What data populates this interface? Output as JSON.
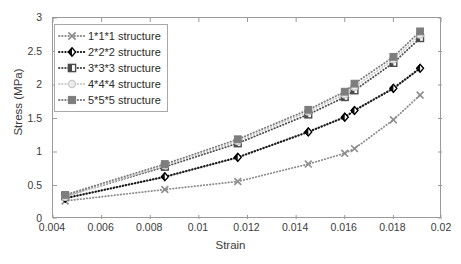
{
  "chart_data": {
    "type": "line",
    "title": "",
    "xlabel": "Strain",
    "ylabel": "Stress (MPa)",
    "xlim": [
      0.004,
      0.02
    ],
    "ylim": [
      0,
      3
    ],
    "xticks": [
      "0.004",
      "0.006",
      "0.008",
      "0.01",
      "0.012",
      "0.014",
      "0.016",
      "0.018",
      "0.02"
    ],
    "xtick_values": [
      0.004,
      0.006,
      0.008,
      0.01,
      0.012,
      0.014,
      0.016,
      0.018,
      0.02
    ],
    "yticks": [
      "0",
      "0.5",
      "1",
      "1.5",
      "2",
      "2.5",
      "3"
    ],
    "ytick_values": [
      0,
      0.5,
      1,
      1.5,
      2,
      2.5,
      3
    ],
    "grid": false,
    "linestyle": "dotted",
    "legend_position": "upper-left",
    "series": [
      {
        "name": "1*1*1 structure",
        "marker": "x-mark",
        "color": "#8c8c8c",
        "x": [
          0.0045,
          0.0086,
          0.0116,
          0.0145,
          0.016,
          0.0164,
          0.018,
          0.0191
        ],
        "y": [
          0.27,
          0.44,
          0.56,
          0.82,
          0.98,
          1.05,
          1.48,
          1.85
        ]
      },
      {
        "name": "2*2*2 structure",
        "marker": "diamond",
        "color": "#1a1a1a",
        "x": [
          0.0045,
          0.0086,
          0.0116,
          0.0145,
          0.016,
          0.0164,
          0.018,
          0.0191
        ],
        "y": [
          0.31,
          0.63,
          0.92,
          1.3,
          1.52,
          1.62,
          1.95,
          2.25
        ]
      },
      {
        "name": "3*3*3 structure",
        "marker": "square-filled-half",
        "color": "#4a4a4a",
        "x": [
          0.0045,
          0.0086,
          0.0116,
          0.0145,
          0.016,
          0.0164,
          0.018,
          0.0191
        ],
        "y": [
          0.34,
          0.78,
          1.13,
          1.56,
          1.82,
          1.92,
          2.33,
          2.7
        ]
      },
      {
        "name": "4*4*4 structure",
        "marker": "circle",
        "color": "#c9c9c9",
        "x": [
          0.0045,
          0.0086,
          0.0116,
          0.0145,
          0.016,
          0.0164,
          0.018,
          0.0191
        ],
        "y": [
          0.33,
          0.8,
          1.16,
          1.6,
          1.86,
          1.97,
          2.38,
          2.75
        ]
      },
      {
        "name": "5*5*5 structure",
        "marker": "square",
        "color": "#7d7d7d",
        "x": [
          0.0045,
          0.0086,
          0.0116,
          0.0145,
          0.016,
          0.0164,
          0.018,
          0.0191
        ],
        "y": [
          0.36,
          0.82,
          1.19,
          1.63,
          1.9,
          2.02,
          2.42,
          2.8
        ]
      }
    ]
  },
  "legend": {
    "items": [
      {
        "label": "1*1*1 structure"
      },
      {
        "label": "2*2*2 structure"
      },
      {
        "label": "3*3*3 structure"
      },
      {
        "label": "4*4*4 structure"
      },
      {
        "label": "5*5*5 structure"
      }
    ]
  }
}
